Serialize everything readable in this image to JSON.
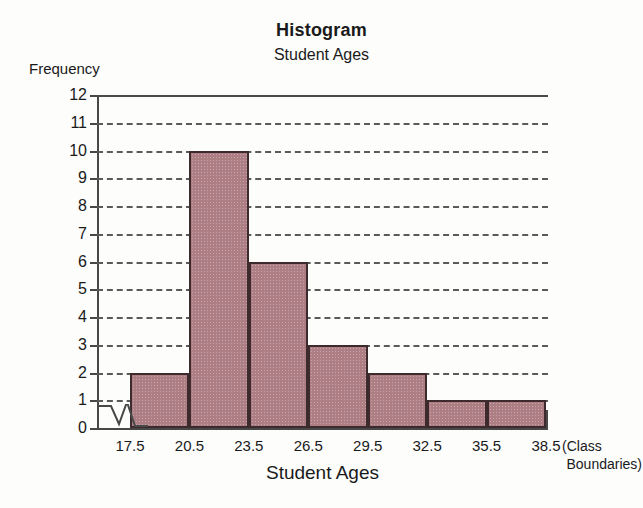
{
  "figure": {
    "title": "Histogram",
    "subtitle": "Student Ages",
    "y_axis_label": "Frequency",
    "x_axis_label": "Student Ages",
    "class_note_line1": "(Class",
    "class_note_line2": "Boundaries)",
    "bar_fill_color": "#ad7f85",
    "bar_border_color": "#3c2a2c",
    "axis_color": "#484848",
    "grid_color": "#5a5a5a",
    "background_color": "#fdfdfc",
    "ghost_top": "",
    "ghost_bottom": ""
  },
  "chart_data": {
    "type": "bar",
    "title": "Histogram",
    "subtitle": "Student Ages",
    "xlabel": "Student Ages",
    "ylabel": "Frequency",
    "ylim": [
      0,
      12
    ],
    "grid": true,
    "legend": "none",
    "note": "(Class Boundaries)",
    "class_boundaries": [
      17.5,
      20.5,
      23.5,
      26.5,
      29.5,
      32.5,
      35.5,
      38.5
    ],
    "categories": [
      "17.5-20.5",
      "20.5-23.5",
      "23.5-26.5",
      "26.5-29.5",
      "29.5-32.5",
      "32.5-35.5",
      "35.5-38.5"
    ],
    "values": [
      2,
      10,
      6,
      3,
      2,
      1,
      1
    ],
    "ytick_labels": [
      "12",
      "11",
      "10",
      "9",
      "8",
      "7",
      "6",
      "5",
      "4",
      "3",
      "2",
      "1",
      "0"
    ],
    "ytick_values": [
      12,
      11,
      10,
      9,
      8,
      7,
      6,
      5,
      4,
      3,
      2,
      1,
      0
    ],
    "xtick_labels": [
      "17.5",
      "20.5",
      "23.5",
      "26.5",
      "29.5",
      "32.5",
      "35.5",
      "38.5"
    ],
    "axis_break": true
  }
}
